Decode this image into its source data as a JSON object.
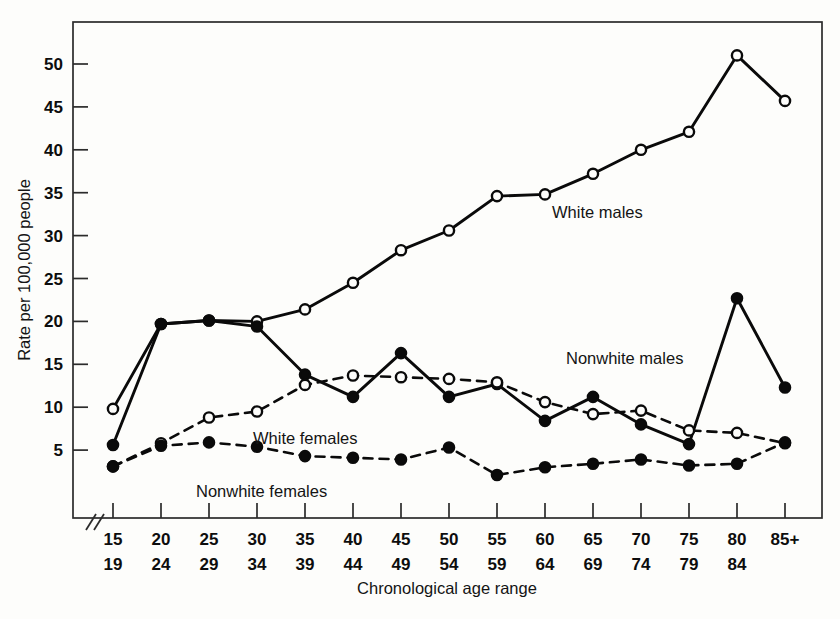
{
  "chart_data": {
    "type": "line",
    "title": "",
    "xlabel": "Chronological age range",
    "ylabel": "Rate per 100,000 people",
    "categories": [
      "15\n19",
      "20\n24",
      "25\n29",
      "30\n34",
      "35\n39",
      "40\n44",
      "45\n49",
      "50\n54",
      "55\n59",
      "60\n64",
      "65\n69",
      "70\n74",
      "75\n79",
      "80\n84",
      "85+"
    ],
    "category_top": [
      "15",
      "20",
      "25",
      "30",
      "35",
      "40",
      "45",
      "50",
      "55",
      "60",
      "65",
      "70",
      "75",
      "80",
      "85+"
    ],
    "category_bottom": [
      "19",
      "24",
      "29",
      "34",
      "39",
      "44",
      "49",
      "54",
      "59",
      "64",
      "69",
      "74",
      "79",
      "84",
      ""
    ],
    "yticks": [
      5,
      10,
      15,
      20,
      25,
      30,
      35,
      40,
      45,
      50
    ],
    "ytick_labels": [
      "5",
      "10",
      "15",
      "20",
      "25",
      "30",
      "35",
      "40",
      "45",
      "50"
    ],
    "ylim": [
      0,
      54
    ],
    "xlim_note": "axis broken near origin",
    "grid": false,
    "legend_position": "inline-annotations",
    "axis_break_symbol": "//",
    "series": [
      {
        "name": "White males",
        "marker": "open-circle",
        "line_style": "solid",
        "color": "#0a0a0a",
        "values": [
          9.8,
          19.7,
          20.1,
          20.0,
          21.4,
          24.5,
          28.3,
          30.6,
          34.6,
          34.8,
          37.2,
          40.0,
          42.1,
          51.0,
          45.7
        ]
      },
      {
        "name": "Nonwhite males",
        "marker": "filled-circle",
        "line_style": "solid",
        "color": "#0a0a0a",
        "values": [
          5.6,
          19.7,
          20.1,
          19.4,
          13.8,
          11.2,
          16.3,
          11.2,
          12.7,
          8.4,
          11.2,
          8.0,
          5.7,
          22.7,
          12.3
        ]
      },
      {
        "name": "White females",
        "marker": "open-circle",
        "line_style": "dashed",
        "color": "#0a0a0a",
        "values": [
          3.1,
          5.8,
          8.8,
          9.5,
          12.6,
          13.7,
          13.5,
          13.3,
          12.9,
          10.6,
          9.2,
          9.6,
          7.3,
          7.0,
          5.8
        ]
      },
      {
        "name": "Nonwhite females",
        "marker": "filled-circle",
        "line_style": "dashed",
        "color": "#0a0a0a",
        "values": [
          3.1,
          5.5,
          5.9,
          5.4,
          4.3,
          4.1,
          3.9,
          5.3,
          2.1,
          3.0,
          3.4,
          3.9,
          3.2,
          3.4,
          5.9
        ]
      }
    ],
    "annotations": [
      {
        "text": "White males",
        "x_category": "55\n59",
        "y_value": 33.5
      },
      {
        "text": "Nonwhite males",
        "x_category": "60\n64",
        "y_value": 21.0
      },
      {
        "text": "White females",
        "x_category": "35\n39",
        "y_value": 9.8
      },
      {
        "text": "Nonwhite females",
        "x_category": "30\n34",
        "y_value": 2.6
      }
    ]
  }
}
